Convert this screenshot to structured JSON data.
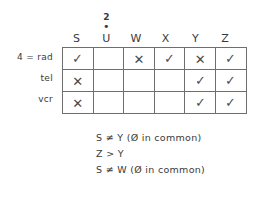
{
  "diagram": {
    "title_visible": false,
    "type": "logic-grid-matrix"
  },
  "matrix": {
    "column_headers": [
      {
        "label": "S",
        "superscript": "",
        "dot": ""
      },
      {
        "label": "U",
        "superscript": "2",
        "dot": "•"
      },
      {
        "label": "W",
        "superscript": "",
        "dot": ""
      },
      {
        "label": "X",
        "superscript": "",
        "dot": ""
      },
      {
        "label": "Y",
        "superscript": "",
        "dot": ""
      },
      {
        "label": "Z",
        "superscript": "",
        "dot": ""
      }
    ],
    "row_headers": [
      {
        "label": "4 = rad"
      },
      {
        "label": "tel"
      },
      {
        "label": "vcr"
      }
    ],
    "cells": [
      [
        {
          "mark": "✓",
          "kind": "check"
        },
        {
          "mark": "",
          "kind": "empty"
        },
        {
          "mark": "✕",
          "kind": "cross"
        },
        {
          "mark": "✓",
          "kind": "check"
        },
        {
          "mark": "✕",
          "kind": "cross"
        },
        {
          "mark": "✓",
          "kind": "check"
        }
      ],
      [
        {
          "mark": "✕",
          "kind": "cross"
        },
        {
          "mark": "",
          "kind": "empty"
        },
        {
          "mark": "",
          "kind": "empty"
        },
        {
          "mark": "",
          "kind": "empty"
        },
        {
          "mark": "✓",
          "kind": "check"
        },
        {
          "mark": "✓",
          "kind": "check"
        }
      ],
      [
        {
          "mark": "✕",
          "kind": "cross"
        },
        {
          "mark": "",
          "kind": "empty"
        },
        {
          "mark": "",
          "kind": "empty"
        },
        {
          "mark": "",
          "kind": "empty"
        },
        {
          "mark": "✓",
          "kind": "check"
        },
        {
          "mark": "✓",
          "kind": "check"
        }
      ]
    ]
  },
  "notes": [
    {
      "text": "S ≠ Y (Ø in common)"
    },
    {
      "text": "Z > Y"
    },
    {
      "text": "S ≠ W (Ø in common)"
    }
  ],
  "colors": {
    "background": "#ffffff",
    "ink": "#3a3a3a",
    "grid_line": "#6e6e6e",
    "mark": "#4a4a4a"
  }
}
